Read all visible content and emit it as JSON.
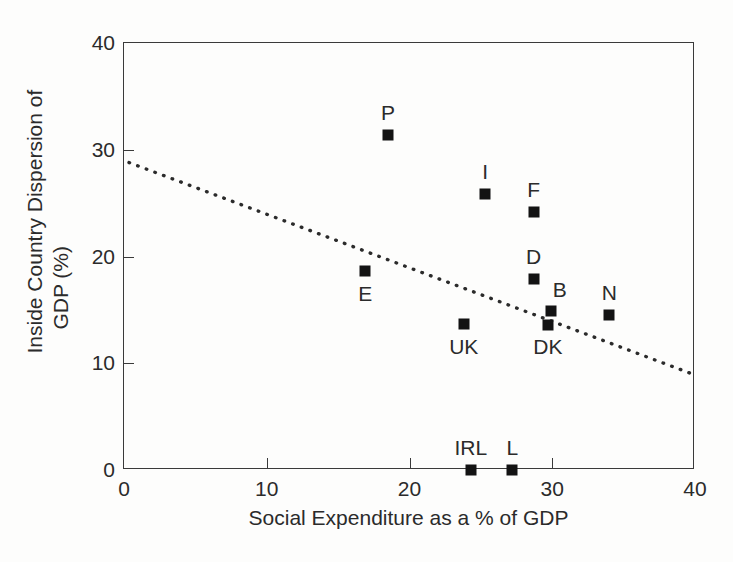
{
  "chart_data": {
    "type": "scatter",
    "title": "",
    "xlabel": "Social Expenditure as a % of GDP",
    "ylabel_line1": "Inside Country Dispersion of",
    "ylabel_line2": "GDP (%)",
    "xlim": [
      0,
      40
    ],
    "ylim": [
      0,
      40
    ],
    "xticks": [
      "0",
      "10",
      "20",
      "30",
      "40"
    ],
    "xtick_values": [
      0,
      10,
      20,
      30,
      40
    ],
    "yticks": [
      "0",
      "10",
      "20",
      "30",
      "40"
    ],
    "ytick_values": [
      0,
      10,
      20,
      30,
      40
    ],
    "grid": false,
    "legend": "none",
    "marker_color": "#131313",
    "axis_color": "#3a3a3a",
    "points": [
      {
        "label": "P",
        "x": 18.5,
        "y": 31.4,
        "label_dx": 0,
        "label_dy": -22
      },
      {
        "label": "I",
        "x": 25.3,
        "y": 25.9,
        "label_dx": 0,
        "label_dy": -22
      },
      {
        "label": "F",
        "x": 28.7,
        "y": 24.2,
        "label_dx": 0,
        "label_dy": -22
      },
      {
        "label": "D",
        "x": 28.7,
        "y": 17.9,
        "label_dx": 0,
        "label_dy": -22
      },
      {
        "label": "B",
        "x": 29.9,
        "y": 14.9,
        "label_dx": 9,
        "label_dy": -21
      },
      {
        "label": "DK",
        "x": 29.7,
        "y": 13.6,
        "label_dx": 0,
        "label_dy": 22
      },
      {
        "label": "N",
        "x": 34.0,
        "y": 14.5,
        "label_dx": 0,
        "label_dy": -22
      },
      {
        "label": "E",
        "x": 16.9,
        "y": 18.6,
        "label_dx": 0,
        "label_dy": 23
      },
      {
        "label": "UK",
        "x": 23.8,
        "y": 13.7,
        "label_dx": 0,
        "label_dy": 23
      },
      {
        "label": "IRL",
        "x": 24.3,
        "y": 0.0,
        "label_dx": 0,
        "label_dy": -22
      },
      {
        "label": "L",
        "x": 27.2,
        "y": 0.0,
        "label_dx": 0,
        "label_dy": -22
      }
    ],
    "trend_line": {
      "style": "dotted",
      "x_start": 0.35,
      "y_start": 28.8,
      "x_end": 40.0,
      "y_end": 8.9
    }
  }
}
